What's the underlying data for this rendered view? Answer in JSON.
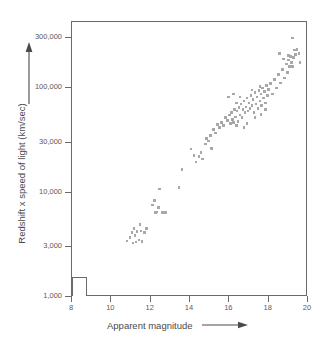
{
  "figure": {
    "background_color": "#ffffff",
    "frame_color": "#6a6a6a",
    "point_color": "#a8a8a8",
    "text_color": "#4a4a4a"
  },
  "axes": {
    "x_title": "Apparent magnitude",
    "y_title": "Redshift x speed of light (km/sec)",
    "x_arrow_icon": "right-arrow-icon",
    "y_arrow_icon": "up-arrow-icon",
    "x_ticks": [
      "8",
      "10",
      "12",
      "14",
      "16",
      "18",
      "20"
    ],
    "y_ticks": [
      "300,000",
      "100,000",
      "30,000",
      "10,000",
      "3,000",
      "1,000"
    ]
  },
  "inset": {
    "label": ""
  },
  "chart_data": {
    "type": "scatter",
    "title": "",
    "xlabel": "Apparent magnitude",
    "ylabel": "Redshift x speed of light (km/sec)",
    "xlim": [
      8,
      20
    ],
    "ylim": [
      1000,
      500000
    ],
    "yscale": "log",
    "xscale": "linear",
    "grid": false,
    "legend": false,
    "xticks": [
      8,
      10,
      12,
      14,
      16,
      18,
      20
    ],
    "yticks": [
      1000,
      3000,
      10000,
      30000,
      100000,
      300000
    ],
    "marker": "square",
    "marker_color": "#a8a8a8",
    "series": [
      {
        "name": "galaxies",
        "points": [
          [
            10.8,
            3450
          ],
          [
            10.95,
            3700
          ],
          [
            11.05,
            4150
          ],
          [
            11.1,
            3300
          ],
          [
            11.15,
            4500
          ],
          [
            11.2,
            3900
          ],
          [
            11.25,
            3350
          ],
          [
            11.3,
            4250
          ],
          [
            11.4,
            3500
          ],
          [
            11.45,
            4950
          ],
          [
            11.5,
            4300
          ],
          [
            11.55,
            3380
          ],
          [
            11.7,
            4150
          ],
          [
            11.8,
            4550
          ],
          [
            12.1,
            7600
          ],
          [
            12.2,
            8400
          ],
          [
            12.25,
            6400
          ],
          [
            12.3,
            6500
          ],
          [
            12.4,
            7200
          ],
          [
            12.45,
            10800
          ],
          [
            12.6,
            6450
          ],
          [
            12.75,
            6400
          ],
          [
            13.45,
            11200
          ],
          [
            13.6,
            16500
          ],
          [
            14.05,
            26000
          ],
          [
            14.2,
            22500
          ],
          [
            14.3,
            19500
          ],
          [
            14.45,
            22000
          ],
          [
            14.55,
            24000
          ],
          [
            14.65,
            21000
          ],
          [
            14.8,
            29000
          ],
          [
            14.85,
            33000
          ],
          [
            14.95,
            31000
          ],
          [
            15.05,
            35000
          ],
          [
            15.1,
            26500
          ],
          [
            15.2,
            40000
          ],
          [
            15.3,
            37000
          ],
          [
            15.4,
            45000
          ],
          [
            15.5,
            42000
          ],
          [
            15.6,
            47000
          ],
          [
            15.7,
            44000
          ],
          [
            15.8,
            52000
          ],
          [
            15.9,
            49000
          ],
          [
            16.0,
            55000
          ],
          [
            16.05,
            46000
          ],
          [
            16.1,
            58000
          ],
          [
            16.15,
            50000
          ],
          [
            16.2,
            47000
          ],
          [
            16.25,
            62000
          ],
          [
            16.3,
            53000
          ],
          [
            16.35,
            44000
          ],
          [
            16.4,
            60000
          ],
          [
            16.45,
            48000
          ],
          [
            16.5,
            65000
          ],
          [
            16.55,
            55000
          ],
          [
            16.6,
            70000
          ],
          [
            16.65,
            52000
          ],
          [
            16.7,
            62000
          ],
          [
            16.75,
            75000
          ],
          [
            16.8,
            58000
          ],
          [
            16.85,
            66000
          ],
          [
            16.9,
            80000
          ],
          [
            16.95,
            60000
          ],
          [
            17.0,
            72000
          ],
          [
            17.05,
            64000
          ],
          [
            17.1,
            85000
          ],
          [
            17.15,
            68000
          ],
          [
            17.2,
            78000
          ],
          [
            17.25,
            58000
          ],
          [
            17.3,
            90000
          ],
          [
            17.35,
            70000
          ],
          [
            17.4,
            82000
          ],
          [
            17.45,
            64000
          ],
          [
            17.5,
            95000
          ],
          [
            17.55,
            75000
          ],
          [
            17.6,
            88000
          ],
          [
            17.65,
            68000
          ],
          [
            17.7,
            100000
          ],
          [
            17.75,
            80000
          ],
          [
            17.8,
            92000
          ],
          [
            17.85,
            72000
          ],
          [
            17.9,
            105000
          ],
          [
            17.95,
            85000
          ],
          [
            16.2,
            88000
          ],
          [
            16.55,
            82000
          ],
          [
            16.9,
            46000
          ],
          [
            17.3,
            52000
          ],
          [
            17.6,
            56000
          ],
          [
            18.0,
            97000
          ],
          [
            18.1,
            110000
          ],
          [
            18.2,
            88000
          ],
          [
            18.3,
            120000
          ],
          [
            18.4,
            100000
          ],
          [
            18.5,
            135000
          ],
          [
            18.6,
            112000
          ],
          [
            18.7,
            150000
          ],
          [
            18.8,
            125000
          ],
          [
            18.9,
            170000
          ],
          [
            18.95,
            140000
          ],
          [
            19.0,
            185000
          ],
          [
            19.05,
            160000
          ],
          [
            19.1,
            200000
          ],
          [
            19.15,
            175000
          ],
          [
            19.2,
            300000
          ],
          [
            19.25,
            195000
          ],
          [
            19.3,
            230000
          ],
          [
            19.35,
            210000
          ],
          [
            19.45,
            235000
          ],
          [
            19.55,
            215000
          ],
          [
            19.6,
            175000
          ],
          [
            18.55,
            215000
          ],
          [
            18.75,
            190000
          ],
          [
            19.0,
            205000
          ],
          [
            19.2,
            160000
          ],
          [
            15.95,
            82000
          ],
          [
            16.35,
            72000
          ],
          [
            16.75,
            42000
          ],
          [
            17.15,
            96000
          ],
          [
            17.55,
            104000
          ],
          [
            17.85,
            62000
          ]
        ]
      }
    ]
  }
}
